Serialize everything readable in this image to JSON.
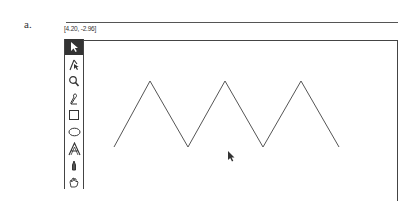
{
  "figure": {
    "label": "a."
  },
  "status": {
    "coordinates": "[4.20, -2.96]"
  },
  "toolbox": {
    "tools": [
      {
        "name": "arrow-select",
        "active": true
      },
      {
        "name": "direct-select",
        "active": false
      },
      {
        "name": "zoom",
        "active": false
      },
      {
        "name": "pencil",
        "active": false
      },
      {
        "name": "rectangle",
        "active": false
      },
      {
        "name": "ellipse",
        "active": false
      },
      {
        "name": "text",
        "active": false
      },
      {
        "name": "pen",
        "active": false
      },
      {
        "name": "hand",
        "active": false
      }
    ]
  },
  "canvas": {
    "stroke_color": "#555555",
    "zigzag_points": [
      [
        114,
        147
      ],
      [
        150,
        81
      ],
      [
        188,
        147
      ],
      [
        225,
        81
      ],
      [
        263,
        147
      ],
      [
        301,
        81
      ],
      [
        339,
        147
      ]
    ],
    "cursor": {
      "x": 228,
      "y": 151
    }
  }
}
